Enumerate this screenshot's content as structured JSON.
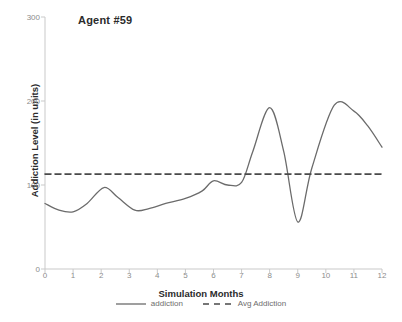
{
  "chart_data": {
    "type": "line",
    "title": "Agent #59",
    "xlabel": "Simulation Months",
    "ylabel": "Addiction Level (in units)",
    "xlim": [
      0,
      12
    ],
    "ylim": [
      0,
      300
    ],
    "grid": false,
    "legend_position": "bottom",
    "xticks": [
      "0",
      "1",
      "2",
      "3",
      "4",
      "5",
      "6",
      "7",
      "8",
      "9",
      "10",
      "11",
      "12"
    ],
    "xtick_values": [
      0,
      1,
      2,
      3,
      4,
      5,
      6,
      7,
      8,
      9,
      10,
      11,
      12
    ],
    "yticks": [
      "0",
      "100",
      "200",
      "300"
    ],
    "ytick_values": [
      0,
      100,
      200,
      300
    ],
    "series": [
      {
        "name": "addiction",
        "style": "solid",
        "color": "#6b6b6b",
        "x": [
          0,
          0.5,
          1,
          1.5,
          2.1,
          2.6,
          3.2,
          3.7,
          4.3,
          5,
          5.6,
          6,
          6.5,
          7,
          7.4,
          8,
          8.5,
          9,
          9.5,
          10.3,
          11,
          11.5,
          12
        ],
        "values": [
          78,
          70,
          68,
          78,
          97,
          85,
          70,
          72,
          78,
          84,
          93,
          105,
          100,
          103,
          140,
          192,
          140,
          56,
          120,
          195,
          188,
          170,
          145
        ]
      },
      {
        "name": "Avg Addiction",
        "style": "dashed",
        "color": "#4a4a4a",
        "x": [
          0,
          12
        ],
        "values": [
          113,
          113
        ]
      }
    ],
    "annotations": []
  },
  "legend": {
    "items": [
      {
        "label": "addiction",
        "style": "solid"
      },
      {
        "label": "Avg Addiction",
        "style": "dashed"
      }
    ]
  },
  "colors": {
    "line": "#6b6b6b",
    "avg_line": "#4a4a4a",
    "axis": "#c9c9c9",
    "tick_text": "#8c8c8c",
    "title_text": "#2b2b2b",
    "background": "#ffffff"
  }
}
